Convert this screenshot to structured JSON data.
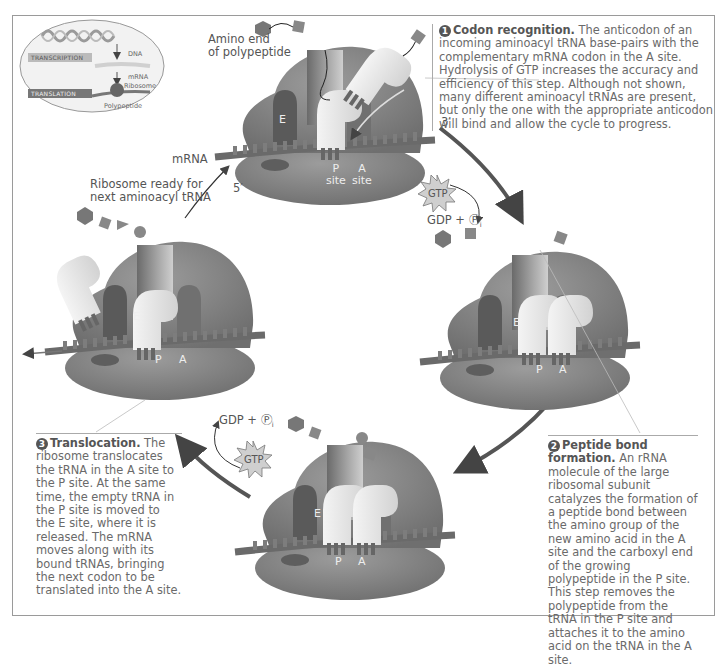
{
  "figure": {
    "inset": {
      "transcription_label": "TRANSCRIPTION",
      "translation_label": "TRANSLATION",
      "dna_label": "DNA",
      "mrna_label": "mRNA",
      "ribosome_label": "Ribosome",
      "polypeptide_label": "Polypeptide"
    },
    "labels": {
      "amino_end_line1": "Amino end",
      "amino_end_line2": "of polypeptide",
      "mrna": "mRNA",
      "five_prime": "5′",
      "three_prime": "3′",
      "ribosome_ready_line1": "Ribosome ready for",
      "ribosome_ready_line2": "next aminoacyl tRNA",
      "gtp_top": "GTP",
      "gdp_pi_top": "GDP + Ⓟ",
      "gtp_bottom": "GTP",
      "gdp_pi_bottom": "GDP + Ⓟ",
      "pi_subscript": "i"
    },
    "ribosomes": [
      {
        "id": "top",
        "e_site": "E",
        "p_site": "P",
        "a_site": "A",
        "p_site_word": "site",
        "a_site_word": "site"
      },
      {
        "id": "right",
        "e_site": "E",
        "p_site": "P",
        "a_site": "A"
      },
      {
        "id": "bottom",
        "e_site": "E",
        "p_site": "P",
        "a_site": "A"
      },
      {
        "id": "left",
        "e_site": "E",
        "p_site": "P",
        "a_site": "A"
      }
    ],
    "steps": [
      {
        "number": "1",
        "title": "Codon recognition.",
        "text": " The anticodon of an incoming aminoacyl tRNA base-pairs with the complementary mRNA codon in the A site. Hydrolysis of GTP increases the accuracy and efficiency of this step. Although not shown, many different aminoacyl tRNAs are present, but only the one with the appropriate anticodon will bind and allow the cycle to progress."
      },
      {
        "number": "2",
        "title": "Peptide bond formation.",
        "text": " An rRNA molecule of the large ribosomal subunit catalyzes the formation of a peptide bond between the amino group of the new amino acid in the A site and the carboxyl end of the growing polypeptide in the P site. This step removes the polypeptide from the tRNA in the P site and attaches it to the amino acid on the tRNA in the A site."
      },
      {
        "number": "3",
        "title": "Translocation.",
        "text": " The ribosome translocates the tRNA in the A site to the P site. At the same time, the empty tRNA in the P site is moved to the E site, where it is released. The mRNA moves along with its bound tRNAs, bringing the next codon to be translated into the A site."
      }
    ],
    "colors": {
      "ribosome": "#8a8a8a",
      "ribosome_dark": "#6e6e6e",
      "trna": "#e6e6e6",
      "mrna": "#7a7a7a",
      "arrow": "#555555",
      "text": "#666666",
      "frame": "#9a9a9a"
    }
  }
}
